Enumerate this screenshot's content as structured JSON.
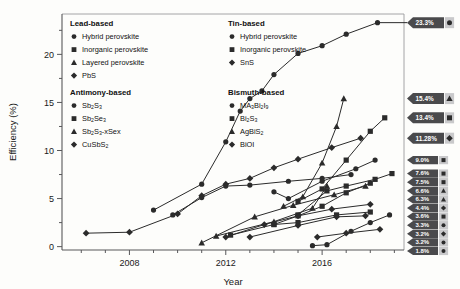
{
  "figure": {
    "title": "",
    "background": "#fdfdfb"
  },
  "axes": {
    "xlabel": "Year",
    "ylabel": "Efficiency (%)",
    "x_ticklabels": [
      "2008",
      "2012",
      "2016"
    ],
    "x_tickvalues": [
      2008,
      2012,
      2016
    ],
    "y_ticklabels": [
      "0",
      "5",
      "10",
      "15",
      "20"
    ],
    "y_tickvalues": [
      0,
      5,
      10,
      15,
      20
    ],
    "xlim": [
      2005.2,
      2019.4
    ],
    "ylim": [
      -0.35,
      24.2
    ],
    "grid": false
  },
  "legend": {
    "position": "inside-top",
    "groups": [
      {
        "title": "Lead-based",
        "items": [
          {
            "marker": "circle",
            "label": "Hybrid perovskite",
            "sub": ""
          },
          {
            "marker": "square",
            "label": "Inorganic perovskite",
            "sub": ""
          },
          {
            "marker": "triangle",
            "label": "Layered perovskite",
            "sub": ""
          },
          {
            "marker": "diamond",
            "label": "PbS",
            "sub": ""
          }
        ]
      },
      {
        "title": "Tin-based",
        "items": [
          {
            "marker": "circle",
            "label": "Hybrid perovskite",
            "sub": ""
          },
          {
            "marker": "square",
            "label": "Inorganic perovskite",
            "sub": ""
          },
          {
            "marker": "diamond",
            "label": "SnS",
            "sub": ""
          }
        ]
      },
      {
        "title": "Antimony-based",
        "items": [
          {
            "marker": "circle",
            "label": "Sb2S3",
            "sub": ""
          },
          {
            "marker": "square",
            "label": "Sb2Se3",
            "sub": ""
          },
          {
            "marker": "triangle",
            "label": "Sb2S3-xSex",
            "sub": ""
          },
          {
            "marker": "diamond",
            "label": "CuSbS2",
            "sub": ""
          }
        ]
      },
      {
        "title": "Bismuth-based",
        "items": [
          {
            "marker": "circle",
            "label": "MA3Bi2I9",
            "sub": ""
          },
          {
            "marker": "square",
            "label": "Bi2S3",
            "sub": ""
          },
          {
            "marker": "triangle",
            "label": "AgBiS2",
            "sub": ""
          },
          {
            "marker": "diamond",
            "label": "BiOI",
            "sub": ""
          }
        ]
      }
    ]
  },
  "callouts": [
    {
      "value": "23.3%",
      "y": 23.3,
      "marker": "circle",
      "size": "big"
    },
    {
      "value": "15.4%",
      "y": 15.4,
      "marker": "triangle",
      "size": "big"
    },
    {
      "value": "13.4%",
      "y": 13.4,
      "marker": "square",
      "size": "big"
    },
    {
      "value": "11.28%",
      "y": 11.28,
      "marker": "diamond",
      "size": "big"
    },
    {
      "value": "9.0%",
      "y": 9.0,
      "marker": "square",
      "size": "small"
    },
    {
      "value": "7.6%",
      "y": 7.6,
      "marker": "square",
      "size": "small"
    },
    {
      "value": "7.5%",
      "y": 7.5,
      "marker": "square",
      "size": "small"
    },
    {
      "value": "6.6%",
      "y": 6.6,
      "marker": "triangle",
      "size": "small"
    },
    {
      "value": "6.3%",
      "y": 6.3,
      "marker": "triangle",
      "size": "small"
    },
    {
      "value": "4.4%",
      "y": 4.4,
      "marker": "diamond",
      "size": "small"
    },
    {
      "value": "3.6%",
      "y": 3.6,
      "marker": "square",
      "size": "small"
    },
    {
      "value": "3.3%",
      "y": 3.3,
      "marker": "circle",
      "size": "small"
    },
    {
      "value": "3.2%",
      "y": 3.2,
      "marker": "diamond",
      "size": "small"
    },
    {
      "value": "3.2%",
      "y": 3.2,
      "marker": "circle",
      "size": "small"
    },
    {
      "value": "1.8%",
      "y": 1.8,
      "marker": "circle",
      "size": "small"
    }
  ],
  "chart_data": {
    "type": "line",
    "title": "",
    "xlabel": "Year",
    "ylabel": "Efficiency (%)",
    "xlim": [
      2005.2,
      2019.4
    ],
    "ylim": [
      -0.35,
      24.2
    ],
    "grid": false,
    "legend_position": "inside-top",
    "x_tick_labels": [
      "2008",
      "2012",
      "2016"
    ],
    "y_tick_labels": [
      "0",
      "5",
      "10",
      "15",
      "20"
    ],
    "series": [
      {
        "name": "Lead hybrid perovskite",
        "group": "Lead-based",
        "marker": "circle",
        "final_value": 23.3,
        "points": [
          [
            2009.0,
            3.8
          ],
          [
            2011.0,
            6.5
          ],
          [
            2012.0,
            10.9
          ],
          [
            2012.6,
            14.1
          ],
          [
            2013.0,
            15.4
          ],
          [
            2013.5,
            16.2
          ],
          [
            2014.0,
            17.9
          ],
          [
            2015.0,
            20.1
          ],
          [
            2016.0,
            20.9
          ],
          [
            2017.0,
            22.1
          ],
          [
            2018.3,
            23.3
          ]
        ]
      },
      {
        "name": "Lead inorganic perovskite",
        "group": "Lead-based",
        "marker": "square",
        "final_value": 13.4,
        "points": [
          [
            2015.0,
            4.7
          ],
          [
            2016.0,
            6.0
          ],
          [
            2017.0,
            9.0
          ],
          [
            2018.0,
            12.0
          ],
          [
            2018.6,
            13.4
          ]
        ]
      },
      {
        "name": "Lead layered perovskite",
        "group": "Lead-based",
        "marker": "triangle",
        "final_value": 15.4,
        "points": [
          [
            2014.4,
            4.2
          ],
          [
            2015.2,
            5.2
          ],
          [
            2016.0,
            8.7
          ],
          [
            2016.6,
            12.5
          ],
          [
            2016.9,
            15.4
          ]
        ]
      },
      {
        "name": "PbS",
        "group": "Lead-based",
        "marker": "diamond",
        "final_value": 11.28,
        "points": [
          [
            2006.2,
            1.4
          ],
          [
            2008.0,
            1.5
          ],
          [
            2010.0,
            3.4
          ],
          [
            2011.0,
            5.3
          ],
          [
            2012.0,
            6.5
          ],
          [
            2013.0,
            7.1
          ],
          [
            2014.0,
            8.2
          ],
          [
            2015.0,
            9.1
          ],
          [
            2016.4,
            10.3
          ],
          [
            2017.6,
            11.28
          ]
        ]
      },
      {
        "name": "Tin hybrid perovskite",
        "group": "Tin-based",
        "marker": "circle",
        "final_value": 9.0,
        "points": [
          [
            2014.0,
            5.7
          ],
          [
            2014.6,
            5.0
          ],
          [
            2016.0,
            6.8
          ],
          [
            2017.4,
            8.1
          ],
          [
            2018.2,
            9.0
          ]
        ]
      },
      {
        "name": "Tin inorganic perovskite",
        "group": "Tin-based",
        "marker": "square",
        "final_value": 7.6,
        "points": [
          [
            2015.0,
            3.3
          ],
          [
            2016.2,
            5.8
          ],
          [
            2017.0,
            6.3
          ],
          [
            2018.2,
            7.0
          ],
          [
            2018.9,
            7.6
          ]
        ]
      },
      {
        "name": "SnS",
        "group": "Tin-based",
        "marker": "diamond",
        "final_value": 4.4,
        "points": [
          [
            2012.0,
            1.0
          ],
          [
            2013.6,
            2.3
          ],
          [
            2015.0,
            3.2
          ],
          [
            2016.4,
            3.9
          ],
          [
            2018.0,
            4.4
          ]
        ]
      },
      {
        "name": "Sb2S3",
        "group": "Antimony-based",
        "marker": "circle",
        "final_value": 7.5,
        "points": [
          [
            2009.8,
            3.3
          ],
          [
            2011.0,
            5.1
          ],
          [
            2012.0,
            6.3
          ],
          [
            2013.0,
            6.4
          ],
          [
            2014.6,
            6.8
          ],
          [
            2016.0,
            7.1
          ],
          [
            2017.2,
            7.5
          ]
        ]
      },
      {
        "name": "Sb2Se3",
        "group": "Antimony-based",
        "marker": "square",
        "final_value": 6.6,
        "points": [
          [
            2014.0,
            2.3
          ],
          [
            2015.0,
            3.2
          ],
          [
            2016.0,
            4.2
          ],
          [
            2017.0,
            5.6
          ],
          [
            2018.0,
            6.6
          ]
        ]
      },
      {
        "name": "Sb2S3-xSex",
        "group": "Antimony-based",
        "marker": "triangle",
        "final_value": 6.3,
        "points": [
          [
            2011.0,
            0.4
          ],
          [
            2013.2,
            3.1
          ],
          [
            2014.8,
            4.3
          ],
          [
            2016.5,
            5.4
          ],
          [
            2017.8,
            6.3
          ]
        ]
      },
      {
        "name": "CuSbS2",
        "group": "Antimony-based",
        "marker": "diamond",
        "final_value": 3.2,
        "points": [
          [
            2013.0,
            1.0
          ],
          [
            2015.0,
            2.2
          ],
          [
            2016.6,
            3.1
          ],
          [
            2017.8,
            3.2
          ]
        ]
      },
      {
        "name": "MA3Bi2I9",
        "group": "Bismuth-based",
        "marker": "circle",
        "final_value": 3.3,
        "points": [
          [
            2015.6,
            0.1
          ],
          [
            2016.2,
            0.2
          ],
          [
            2017.2,
            1.6
          ],
          [
            2018.0,
            2.5
          ],
          [
            2018.8,
            3.3
          ]
        ]
      },
      {
        "name": "Bi2S3",
        "group": "Bismuth-based",
        "marker": "square",
        "final_value": 3.6,
        "points": [
          [
            2012.2,
            1.2
          ],
          [
            2014.0,
            2.3
          ],
          [
            2015.0,
            2.5
          ],
          [
            2016.6,
            3.3
          ],
          [
            2018.0,
            3.6
          ]
        ]
      },
      {
        "name": "AgBiS2",
        "group": "Bismuth-based",
        "marker": "triangle",
        "final_value": 6.3,
        "points": [
          [
            2011.6,
            1.1
          ],
          [
            2014.0,
            2.6
          ],
          [
            2015.6,
            4.0
          ],
          [
            2016.2,
            6.3
          ]
        ]
      },
      {
        "name": "BiOI",
        "group": "Bismuth-based",
        "marker": "diamond",
        "final_value": 1.8,
        "points": [
          [
            2015.8,
            1.0
          ],
          [
            2017.0,
            1.4
          ],
          [
            2018.4,
            1.8
          ]
        ]
      }
    ]
  }
}
